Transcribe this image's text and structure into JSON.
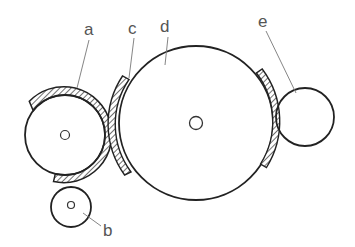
{
  "diagram": {
    "type": "roller-arrangement",
    "stroke_color": "#222222",
    "label_color": "#555555",
    "labels": {
      "a": "a",
      "b": "b",
      "c": "c",
      "d": "d",
      "e": "e"
    },
    "components": [
      {
        "id": "a",
        "shape": "circle-with-hatched-arc-guard",
        "cx": 65,
        "cy": 135,
        "r": 40
      },
      {
        "id": "b",
        "shape": "circle",
        "cx": 71,
        "cy": 207,
        "r": 20
      },
      {
        "id": "c",
        "shape": "hatched-arc-guard",
        "on": "d",
        "side": "left"
      },
      {
        "id": "d",
        "shape": "circle",
        "cx": 196,
        "cy": 123,
        "r": 77
      },
      {
        "id": "e",
        "shape": "circle",
        "cx": 305,
        "cy": 117,
        "r": 29
      }
    ]
  }
}
